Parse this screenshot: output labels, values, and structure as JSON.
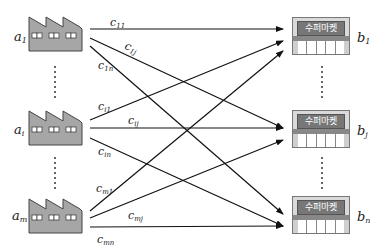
{
  "diagram": {
    "type": "transportation-problem bipartite network",
    "sources": [
      {
        "id": "a1",
        "label": "a",
        "sub": "1",
        "icon": "factory-icon"
      },
      {
        "id": "ai",
        "label": "a",
        "sub": "i",
        "icon": "factory-icon"
      },
      {
        "id": "am",
        "label": "a",
        "sub": "m",
        "icon": "factory-icon"
      }
    ],
    "destinations": [
      {
        "id": "b1",
        "label": "b",
        "sub": "1",
        "icon": "supermarket-icon",
        "sign": "수퍼마켓"
      },
      {
        "id": "bj",
        "label": "b",
        "sub": "j",
        "icon": "supermarket-icon",
        "sign": "수퍼마켓"
      },
      {
        "id": "bn",
        "label": "b",
        "sub": "n",
        "icon": "supermarket-icon",
        "sign": "수퍼마켓"
      }
    ],
    "edges": [
      {
        "from": "a1",
        "to": "b1",
        "label": "c",
        "sub": "11"
      },
      {
        "from": "a1",
        "to": "bj",
        "label": "c",
        "sub": "1j"
      },
      {
        "from": "a1",
        "to": "bn",
        "label": "c",
        "sub": "1n"
      },
      {
        "from": "ai",
        "to": "b1",
        "label": "c",
        "sub": "i1"
      },
      {
        "from": "ai",
        "to": "bj",
        "label": "c",
        "sub": "ij"
      },
      {
        "from": "ai",
        "to": "bn",
        "label": "c",
        "sub": "in"
      },
      {
        "from": "am",
        "to": "b1",
        "label": "c",
        "sub": "m1"
      },
      {
        "from": "am",
        "to": "bj",
        "label": "c",
        "sub": "mj"
      },
      {
        "from": "am",
        "to": "bn",
        "label": "c",
        "sub": "mn"
      }
    ],
    "colors": {
      "factory_fill": "#a6a6a6",
      "factory_stroke": "#444444",
      "line": "#111111",
      "sign_fill": "#777777"
    }
  }
}
